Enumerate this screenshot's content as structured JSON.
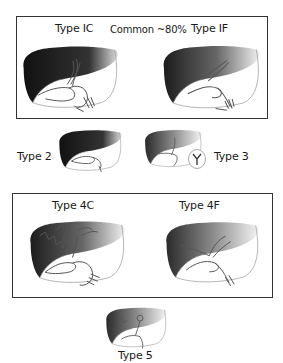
{
  "panels": {
    "top": {
      "left_label": "Type IC",
      "center_label": "Common ~80%",
      "right_label": "Type IF"
    },
    "middle": {
      "left_label": "Type 2",
      "right_label": "Type 3"
    },
    "lower": {
      "left_label": "Type 4C",
      "right_label": "Type 4F"
    },
    "bottom": {
      "label": "Type 5"
    }
  },
  "colors": {
    "liver_dark": "#1e1e1e",
    "liver_light": "#f2f2f2",
    "duct_stroke": "#555555",
    "frame": "#333333"
  }
}
